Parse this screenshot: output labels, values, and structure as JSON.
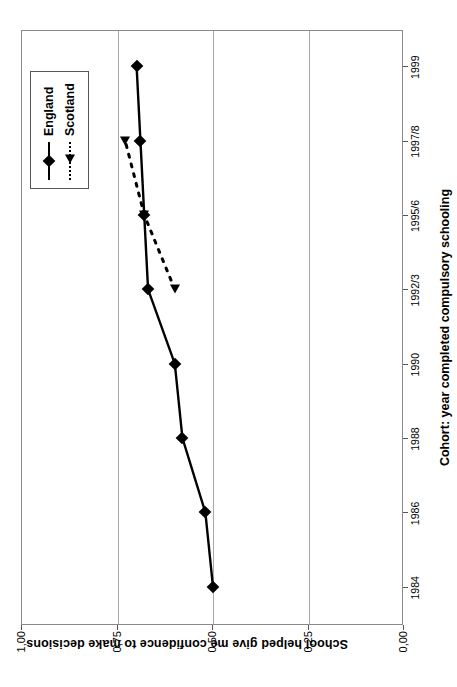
{
  "chart_data": {
    "type": "line",
    "title": "",
    "xlabel": "Cohort: year completed compulsory schooling",
    "ylabel": "School helped give me confidence to make decisions",
    "categories": [
      "1984",
      "1986",
      "1988",
      "1990",
      "1992/3",
      "1995/6",
      "1997/8",
      "1999"
    ],
    "ytick_labels": [
      "1,00",
      "0,75",
      "0,50",
      "0,25",
      "0,00"
    ],
    "ytick_values": [
      1.0,
      0.75,
      0.5,
      0.25,
      0.0
    ],
    "ylim": [
      0.0,
      1.0
    ],
    "grid": true,
    "legend_position": "top-right",
    "series": [
      {
        "name": "England",
        "marker": "diamond",
        "linestyle": "solid",
        "color": "#000000",
        "values": [
          0.5,
          0.52,
          0.58,
          0.6,
          0.67,
          0.68,
          0.69,
          0.7
        ]
      },
      {
        "name": "Scotland",
        "marker": "triangle",
        "linestyle": "dashed",
        "color": "#000000",
        "values": [
          null,
          null,
          null,
          null,
          0.6,
          0.68,
          0.73,
          null
        ]
      }
    ]
  },
  "legend": {
    "entries": [
      {
        "label": "England"
      },
      {
        "label": "Scotland"
      }
    ]
  },
  "axes": {
    "x_title": "Cohort: year completed compulsory schooling",
    "y_title": "School helped give me confidence to make decisions"
  },
  "colors": {
    "series": "#000000",
    "gridline": "#a9a9a9",
    "axis": "#8a8a8a",
    "background": "#ffffff"
  }
}
